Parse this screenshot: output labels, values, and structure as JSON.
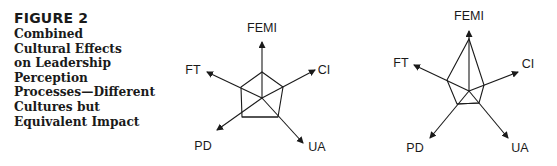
{
  "figure": {
    "label": "FIGURE 2",
    "title": "Combined\nCultural Effects\non Leadership\nPerception\nProcesses—Different\nCultures but\nEquivalent Impact"
  },
  "colors": {
    "ink": "#1a1a1a",
    "background": "#ffffff"
  },
  "diagrams": [
    {
      "name": "culture-a",
      "axes": [
        {
          "label": "FEMI",
          "tip": [
            262,
            42
          ],
          "vertex": [
            262,
            72
          ],
          "label_pos": [
            262,
            32
          ]
        },
        {
          "label": "CI",
          "tip": [
            315,
            70
          ],
          "vertex": [
            283,
            87
          ],
          "label_pos": [
            324,
            74
          ]
        },
        {
          "label": "UA",
          "tip": [
            303,
            143
          ],
          "vertex": [
            278,
            117
          ],
          "label_pos": [
            317,
            151
          ]
        },
        {
          "label": "PD",
          "tip": [
            217,
            130
          ],
          "vertex": [
            242,
            117
          ],
          "label_pos": [
            203,
            150
          ]
        },
        {
          "label": "FT",
          "tip": [
            207,
            72
          ],
          "vertex": [
            241,
            87
          ],
          "label_pos": [
            193,
            74
          ]
        }
      ],
      "center": [
        262,
        98
      ]
    },
    {
      "name": "culture-b",
      "axes": [
        {
          "label": "FEMI",
          "tip": [
            469,
            31
          ],
          "vertex": [
            469,
            39
          ],
          "label_pos": [
            469,
            20
          ]
        },
        {
          "label": "CI",
          "tip": [
            518,
            72
          ],
          "vertex": [
            484,
            85
          ],
          "label_pos": [
            528,
            68
          ]
        },
        {
          "label": "UA",
          "tip": [
            508,
            138
          ],
          "vertex": [
            479,
            103
          ],
          "label_pos": [
            520,
            152
          ]
        },
        {
          "label": "PD",
          "tip": [
            430,
            138
          ],
          "vertex": [
            457,
            104
          ],
          "label_pos": [
            415,
            152
          ]
        },
        {
          "label": "FT",
          "tip": [
            414,
            65
          ],
          "vertex": [
            447,
            80
          ],
          "label_pos": [
            401,
            67
          ]
        }
      ],
      "center": [
        469,
        91
      ]
    }
  ]
}
